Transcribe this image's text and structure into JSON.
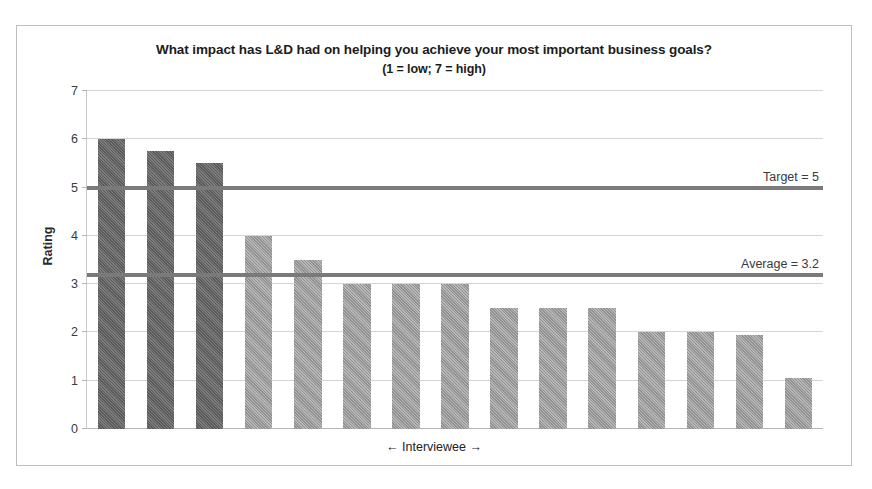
{
  "chart_data": {
    "type": "bar",
    "title": "What impact has L&D had on helping you achieve your most important business goals?",
    "subtitle": "(1 = low; 7 = high)",
    "xlabel": "← Interviewee →",
    "ylabel": "Rating",
    "ylim": [
      0,
      7
    ],
    "yticks": [
      "0",
      "1",
      "2",
      "3",
      "4",
      "5",
      "6",
      "7"
    ],
    "grid": true,
    "legend": "none",
    "categories": [
      "1",
      "2",
      "3",
      "4",
      "5",
      "6",
      "7",
      "8",
      "9",
      "10",
      "11",
      "12",
      "13",
      "14",
      "15"
    ],
    "values": [
      6.0,
      5.75,
      5.5,
      4.0,
      3.5,
      3.0,
      3.0,
      3.0,
      2.5,
      2.5,
      2.5,
      2.0,
      2.0,
      1.95,
      1.05
    ],
    "bar_shades": [
      "dark",
      "dark",
      "dark",
      "light",
      "light",
      "light",
      "light",
      "light",
      "light",
      "light",
      "light",
      "light",
      "light",
      "light",
      "light"
    ],
    "reference_lines": [
      {
        "label": "Target = 5",
        "value": 5.0
      },
      {
        "label": "Average = 3.2",
        "value": 3.2
      }
    ],
    "colors": {
      "bar_dark": "#6e6e6e",
      "bar_light": "#a9a9a9",
      "reference_line": "#7a7a7a",
      "gridline": "#d4d4d4",
      "frame": "#bdbdbd",
      "background": "#ffffff",
      "title_text": "#1c1c1c"
    }
  }
}
